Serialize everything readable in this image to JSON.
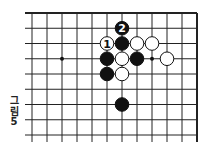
{
  "figure": {
    "caption_chars": [
      "그",
      "림",
      "5"
    ],
    "caption": "그림 5"
  },
  "board": {
    "columns": 12,
    "rows": 9,
    "origin_x": 32,
    "origin_y": 13,
    "spacing_x": 15,
    "spacing_y": 15.25,
    "edges": {
      "top": true,
      "right": true,
      "left": false,
      "bottom": false
    },
    "line_color": "#222222",
    "star_points": [
      {
        "col": 2,
        "row": 3
      },
      {
        "col": 8,
        "row": 3
      }
    ],
    "stones": [
      {
        "col": 6,
        "row": 1,
        "color": "black",
        "label": "2"
      },
      {
        "col": 5,
        "row": 2,
        "color": "white",
        "label": "1"
      },
      {
        "col": 6,
        "row": 2,
        "color": "black",
        "label": ""
      },
      {
        "col": 7,
        "row": 2,
        "color": "white",
        "label": ""
      },
      {
        "col": 8,
        "row": 2,
        "color": "white",
        "label": ""
      },
      {
        "col": 5,
        "row": 3,
        "color": "black",
        "label": ""
      },
      {
        "col": 6,
        "row": 3,
        "color": "white",
        "label": ""
      },
      {
        "col": 7,
        "row": 3,
        "color": "black",
        "label": ""
      },
      {
        "col": 9,
        "row": 3,
        "color": "white",
        "label": ""
      },
      {
        "col": 5,
        "row": 4,
        "color": "black",
        "label": ""
      },
      {
        "col": 6,
        "row": 4,
        "color": "white",
        "label": ""
      },
      {
        "col": 6,
        "row": 6,
        "color": "black",
        "label": ""
      }
    ]
  }
}
